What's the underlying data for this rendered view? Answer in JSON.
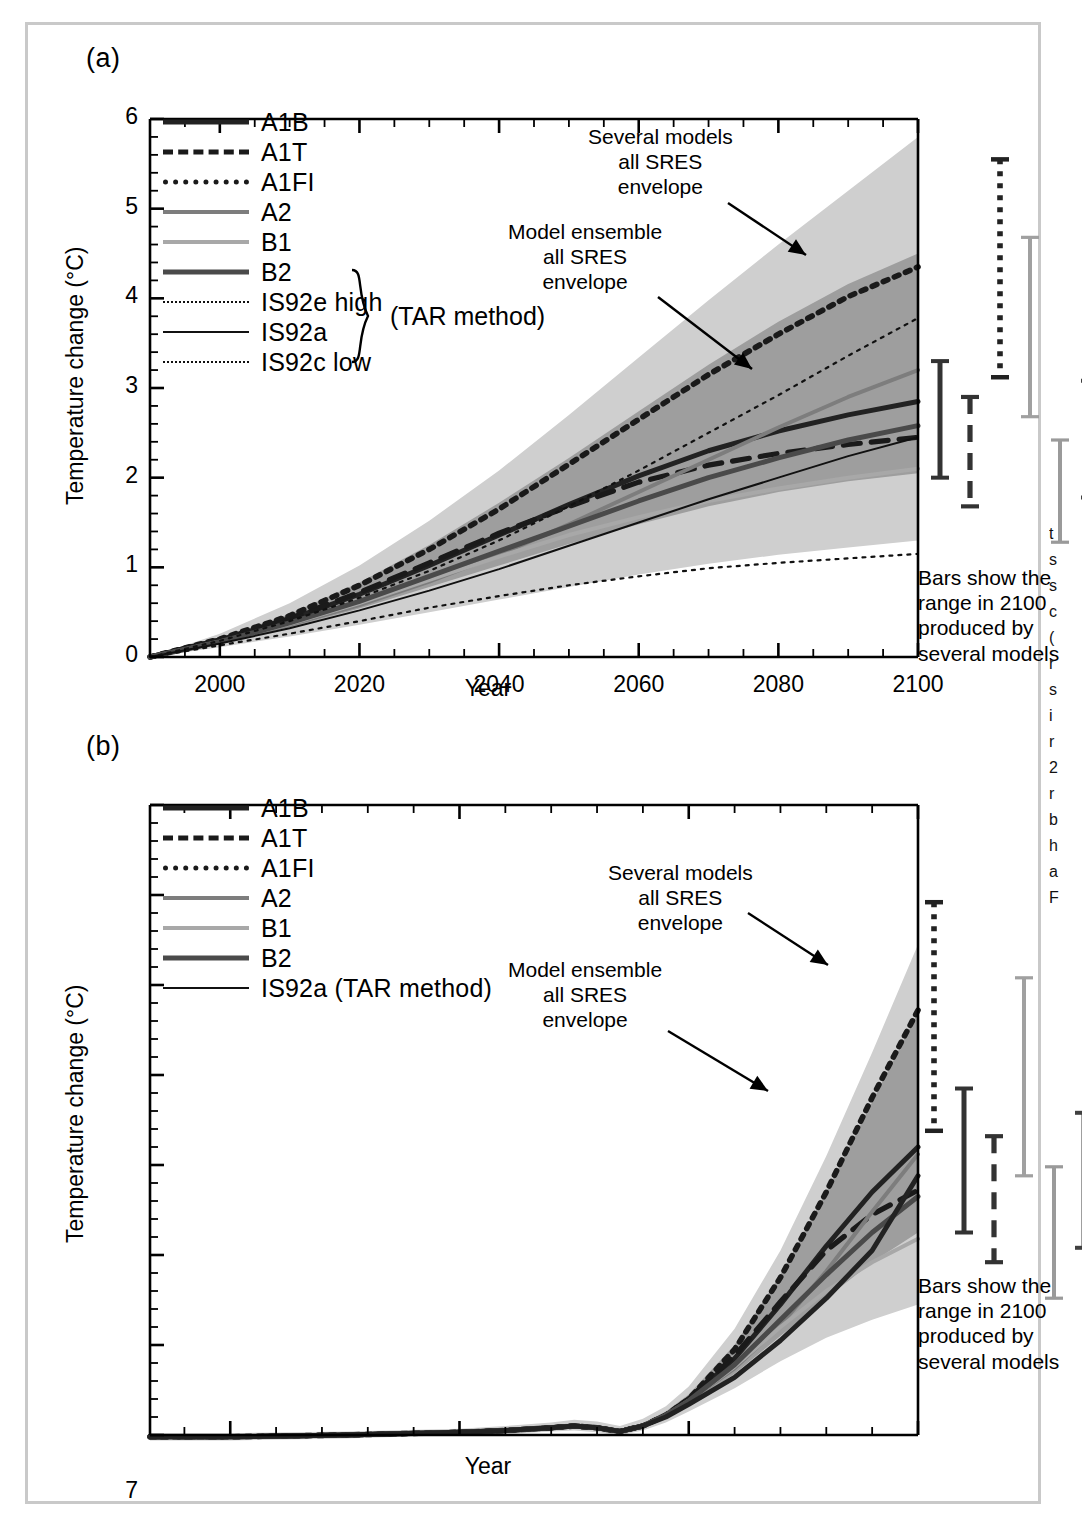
{
  "figure": {
    "border_color": "#c9c9c9",
    "background": "#ffffff"
  },
  "panels": [
    {
      "tag": "(a)",
      "ylabel": "Temperature change (°C)",
      "xlabel": "Year",
      "yticks": [
        "0",
        "1",
        "2",
        "3",
        "4",
        "5",
        "6"
      ],
      "xticks": [
        "2000",
        "2020",
        "2040",
        "2060",
        "2080",
        "2100"
      ],
      "annotations": [
        {
          "name": "several-models-envelope",
          "lines": [
            "Several models",
            "all SRES",
            "envelope"
          ]
        },
        {
          "name": "model-ensemble-envelope",
          "lines": [
            "Model ensemble",
            "all SRES",
            "envelope"
          ]
        }
      ],
      "bars_caption": [
        "Bars show the",
        "range in 2100",
        "produced by",
        "several models"
      ],
      "legend": [
        {
          "label": "A1B",
          "style": "solid-thick",
          "color": "#222222"
        },
        {
          "label": "A1T",
          "style": "dashed-thick",
          "color": "#1a1a1a"
        },
        {
          "label": "A1FI",
          "style": "dotted-thick",
          "color": "#1a1a1a"
        },
        {
          "label": "A2",
          "style": "solid-medium",
          "color": "#7d7d7d"
        },
        {
          "label": "B1",
          "style": "solid-medium",
          "color": "#a8a8a8"
        },
        {
          "label": "B2",
          "style": "solid-thick",
          "color": "#4a4a4a"
        },
        {
          "label": "IS92e high",
          "style": "dotted-thin",
          "color": "#111111"
        },
        {
          "label": "IS92a",
          "style": "solid-thin",
          "color": "#111111"
        },
        {
          "label": "IS92c low",
          "style": "dotted-thin",
          "color": "#111111"
        }
      ],
      "legend_brace_label": "(TAR method)"
    },
    {
      "tag": "(b)",
      "ylabel": "Temperature change (°C)",
      "xlabel": "Year",
      "yticks": [
        "0",
        "1",
        "2",
        "3",
        "4",
        "5",
        "6",
        "7"
      ],
      "xticks": [
        "1800",
        "1900",
        "2000",
        "2100"
      ],
      "annotations": [
        {
          "name": "several-models-envelope",
          "lines": [
            "Several models",
            "all SRES",
            "envelope"
          ]
        },
        {
          "name": "model-ensemble-envelope",
          "lines": [
            "Model ensemble",
            "all SRES",
            "envelope"
          ]
        }
      ],
      "bars_caption": [
        "Bars show the",
        "range in 2100",
        "produced by",
        "several models"
      ],
      "legend": [
        {
          "label": "A1B",
          "style": "solid-thick",
          "color": "#222222"
        },
        {
          "label": "A1T",
          "style": "dashed-thick",
          "color": "#1a1a1a"
        },
        {
          "label": "A1FI",
          "style": "dotted-thick",
          "color": "#1a1a1a"
        },
        {
          "label": "A2",
          "style": "solid-medium",
          "color": "#7d7d7d"
        },
        {
          "label": "B1",
          "style": "solid-medium",
          "color": "#a8a8a8"
        },
        {
          "label": "B2",
          "style": "solid-thick",
          "color": "#4a4a4a"
        },
        {
          "label": "IS92a (TAR method)",
          "style": "solid-thin",
          "color": "#111111"
        }
      ]
    }
  ],
  "chart_data": [
    {
      "type": "line",
      "panel": "(a)",
      "title": "",
      "xlabel": "Year",
      "ylabel": "Temperature change (°C)",
      "xlim": [
        1990,
        2100
      ],
      "ylim": [
        0,
        6
      ],
      "grid": false,
      "legend_position": "upper-left",
      "x": [
        1990,
        2000,
        2010,
        2020,
        2030,
        2040,
        2050,
        2060,
        2070,
        2080,
        2090,
        2100
      ],
      "series": [
        {
          "name": "A1B",
          "values": [
            0.0,
            0.19,
            0.42,
            0.7,
            1.02,
            1.36,
            1.7,
            2.02,
            2.3,
            2.52,
            2.7,
            2.85
          ]
        },
        {
          "name": "A1T",
          "values": [
            0.0,
            0.19,
            0.43,
            0.72,
            1.05,
            1.38,
            1.68,
            1.95,
            2.14,
            2.27,
            2.37,
            2.45
          ]
        },
        {
          "name": "A1FI",
          "values": [
            0.0,
            0.2,
            0.46,
            0.8,
            1.2,
            1.65,
            2.15,
            2.65,
            3.15,
            3.6,
            4.02,
            4.35
          ]
        },
        {
          "name": "A2",
          "values": [
            0.0,
            0.17,
            0.36,
            0.58,
            0.84,
            1.14,
            1.48,
            1.84,
            2.2,
            2.56,
            2.9,
            3.2
          ]
        },
        {
          "name": "B1",
          "values": [
            0.0,
            0.17,
            0.37,
            0.6,
            0.86,
            1.12,
            1.36,
            1.56,
            1.74,
            1.88,
            2.0,
            2.1
          ]
        },
        {
          "name": "B2",
          "values": [
            0.0,
            0.17,
            0.38,
            0.62,
            0.9,
            1.18,
            1.46,
            1.74,
            2.0,
            2.22,
            2.42,
            2.58
          ]
        },
        {
          "name": "IS92e high",
          "values": [
            0.0,
            0.18,
            0.4,
            0.66,
            0.96,
            1.3,
            1.68,
            2.08,
            2.5,
            2.92,
            3.36,
            3.78
          ]
        },
        {
          "name": "IS92a",
          "values": [
            0.0,
            0.15,
            0.32,
            0.52,
            0.74,
            0.98,
            1.24,
            1.5,
            1.76,
            2.0,
            2.24,
            2.45
          ]
        },
        {
          "name": "IS92c low",
          "values": [
            0.0,
            0.13,
            0.26,
            0.4,
            0.55,
            0.68,
            0.8,
            0.9,
            0.99,
            1.05,
            1.1,
            1.15
          ]
        }
      ],
      "envelopes": [
        {
          "name": "Several models all SRES envelope",
          "shade": "#cfcfcf",
          "upper": [
            0.0,
            0.26,
            0.6,
            1.02,
            1.52,
            2.08,
            2.7,
            3.34,
            3.98,
            4.6,
            5.2,
            5.8
          ],
          "lower": [
            0.0,
            0.11,
            0.23,
            0.36,
            0.5,
            0.64,
            0.78,
            0.92,
            1.04,
            1.14,
            1.22,
            1.3
          ]
        },
        {
          "name": "Model ensemble all SRES envelope",
          "shade": "#9e9e9e",
          "upper": [
            0.0,
            0.21,
            0.48,
            0.83,
            1.25,
            1.72,
            2.22,
            2.74,
            3.26,
            3.74,
            4.16,
            4.5
          ],
          "lower": [
            0.0,
            0.15,
            0.33,
            0.54,
            0.78,
            1.02,
            1.26,
            1.48,
            1.68,
            1.84,
            1.96,
            2.05
          ]
        }
      ],
      "bars_2100": [
        {
          "name": "A1B",
          "low": 2.0,
          "high": 3.3,
          "style": "solid-thick",
          "color": "#333333"
        },
        {
          "name": "A1T",
          "low": 1.68,
          "high": 2.9,
          "style": "dashed-thick",
          "color": "#333333"
        },
        {
          "name": "A1FI",
          "low": 3.12,
          "high": 5.55,
          "style": "dotted-thick",
          "color": "#222222"
        },
        {
          "name": "A2",
          "low": 2.68,
          "high": 4.68,
          "style": "solid-medium",
          "color": "#a0a0a0"
        },
        {
          "name": "B1",
          "low": 1.28,
          "high": 2.42,
          "style": "solid-medium",
          "color": "#9a9a9a"
        },
        {
          "name": "B2",
          "low": 1.78,
          "high": 3.08,
          "style": "solid-thick",
          "color": "#404040"
        }
      ]
    },
    {
      "type": "line",
      "panel": "(b)",
      "title": "",
      "xlabel": "Year",
      "ylabel": "Temperature change (°C)",
      "xlim": [
        1765,
        2100
      ],
      "ylim": [
        0,
        7
      ],
      "grid": false,
      "legend_position": "upper-left",
      "x": [
        1765,
        1800,
        1850,
        1900,
        1920,
        1940,
        1950,
        1960,
        1970,
        1980,
        1990,
        2000,
        2020,
        2040,
        2060,
        2080,
        2100
      ],
      "series": [
        {
          "name": "A1B",
          "values": [
            -0.02,
            -0.02,
            0.0,
            0.03,
            0.05,
            0.08,
            0.1,
            0.08,
            0.04,
            0.1,
            0.22,
            0.4,
            0.85,
            1.45,
            2.1,
            2.7,
            3.2
          ]
        },
        {
          "name": "A1T",
          "values": [
            -0.02,
            -0.02,
            0.0,
            0.03,
            0.05,
            0.08,
            0.1,
            0.08,
            0.04,
            0.1,
            0.22,
            0.4,
            0.88,
            1.48,
            2.05,
            2.45,
            2.72
          ]
        },
        {
          "name": "A1FI",
          "values": [
            -0.02,
            -0.02,
            0.0,
            0.03,
            0.05,
            0.08,
            0.1,
            0.08,
            0.04,
            0.1,
            0.22,
            0.4,
            0.95,
            1.75,
            2.7,
            3.75,
            4.72
          ]
        },
        {
          "name": "A2",
          "values": [
            -0.02,
            -0.02,
            0.0,
            0.03,
            0.05,
            0.08,
            0.1,
            0.08,
            0.04,
            0.1,
            0.22,
            0.38,
            0.74,
            1.22,
            1.82,
            2.48,
            3.12
          ]
        },
        {
          "name": "B1",
          "values": [
            -0.02,
            -0.02,
            0.0,
            0.03,
            0.05,
            0.08,
            0.1,
            0.08,
            0.04,
            0.1,
            0.22,
            0.38,
            0.76,
            1.2,
            1.6,
            1.92,
            2.18
          ]
        },
        {
          "name": "B2",
          "values": [
            -0.02,
            -0.02,
            0.0,
            0.03,
            0.05,
            0.08,
            0.1,
            0.08,
            0.04,
            0.1,
            0.22,
            0.38,
            0.78,
            1.28,
            1.78,
            2.25,
            2.65
          ]
        },
        {
          "name": "IS92a",
          "values": [
            -0.02,
            -0.02,
            0.0,
            0.03,
            0.05,
            0.08,
            0.1,
            0.08,
            0.04,
            0.1,
            0.2,
            0.34,
            0.64,
            1.05,
            1.52,
            2.05,
            2.88
          ]
        }
      ],
      "envelopes": [
        {
          "name": "Several models all SRES envelope",
          "shade": "#cfcfcf",
          "upper": [
            0.02,
            0.02,
            0.04,
            0.07,
            0.1,
            0.14,
            0.17,
            0.15,
            0.1,
            0.18,
            0.32,
            0.54,
            1.18,
            2.05,
            3.1,
            4.25,
            5.45
          ],
          "lower": [
            -0.06,
            -0.06,
            -0.04,
            0.0,
            0.01,
            0.04,
            0.05,
            0.03,
            0.0,
            0.05,
            0.14,
            0.26,
            0.52,
            0.82,
            1.08,
            1.28,
            1.45
          ]
        },
        {
          "name": "Model ensemble all SRES envelope",
          "shade": "#9e9e9e",
          "upper": [
            0.0,
            0.0,
            0.02,
            0.05,
            0.07,
            0.11,
            0.13,
            0.11,
            0.06,
            0.13,
            0.26,
            0.45,
            1.0,
            1.78,
            2.7,
            3.7,
            4.7
          ],
          "lower": [
            -0.04,
            -0.04,
            -0.02,
            0.02,
            0.03,
            0.06,
            0.08,
            0.06,
            0.02,
            0.08,
            0.19,
            0.33,
            0.68,
            1.1,
            1.52,
            1.92,
            2.25
          ]
        }
      ],
      "bars_2100": [
        {
          "name": "A1FI",
          "low": 3.38,
          "high": 5.92,
          "style": "dotted-thick",
          "color": "#222222"
        },
        {
          "name": "A1B",
          "low": 2.25,
          "high": 3.85,
          "style": "solid-thick",
          "color": "#333333"
        },
        {
          "name": "A1T",
          "low": 1.92,
          "high": 3.32,
          "style": "dashed-thick",
          "color": "#333333"
        },
        {
          "name": "A2",
          "low": 2.88,
          "high": 5.08,
          "style": "solid-medium",
          "color": "#a0a0a0"
        },
        {
          "name": "B1",
          "low": 1.52,
          "high": 2.98,
          "style": "solid-medium",
          "color": "#9a9a9a"
        },
        {
          "name": "B2",
          "low": 2.08,
          "high": 3.58,
          "style": "solid-thick",
          "color": "#404040"
        }
      ]
    }
  ],
  "side_text_column": [
    "",
    "t",
    "s",
    "s",
    "c",
    "(",
    "r",
    "s",
    "i",
    "r",
    "2",
    "r",
    "b",
    "h",
    "a",
    "F"
  ]
}
